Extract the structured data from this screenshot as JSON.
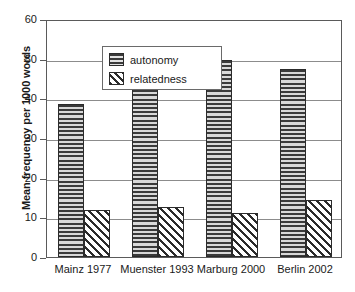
{
  "chart_data": {
    "type": "bar",
    "title": "",
    "xlabel": "",
    "ylabel": "Mean frequency per 1000 words",
    "ylim": [
      0,
      60
    ],
    "yticks": [
      0,
      10,
      20,
      30,
      40,
      50,
      60
    ],
    "ytick_labels": [
      "0",
      "10",
      "20",
      "30",
      "40",
      "50",
      "60"
    ],
    "grid": true,
    "legend_position": "upper-left",
    "categories": [
      "Mainz 1977",
      "Muenster 1993",
      "Marburg 2000",
      "Berlin 2002"
    ],
    "series": [
      {
        "name": "autonomy",
        "pattern": "horizontal-stripes",
        "values": [
          38.6,
          43.3,
          49.6,
          47.5
        ]
      },
      {
        "name": "relatedness",
        "pattern": "diagonal-hatch",
        "values": [
          11.9,
          12.5,
          11.1,
          14.3
        ]
      }
    ]
  },
  "legend": {
    "entries": [
      {
        "label": "autonomy",
        "swatch": "horizontal-stripes-swatch"
      },
      {
        "label": "relatedness",
        "swatch": "diagonal-hatch-swatch"
      }
    ]
  },
  "colors": {
    "frame": "#5a5a5a",
    "gridline": "#8c8c8c",
    "bar_outline": "#2b2b2b",
    "autonomy_fill": "#c9c9c9",
    "relatedness_fill": "#ffffff",
    "text": "#1a1a1a",
    "background": "#ffffff"
  }
}
